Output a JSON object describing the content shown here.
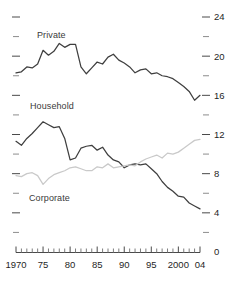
{
  "chart_data": {
    "type": "line",
    "title": "",
    "subtitle": "",
    "xlabel": "",
    "ylabel": "",
    "grid": false,
    "legend_position": "inline-annotations",
    "xlim": [
      1970,
      2004
    ],
    "ylim": [
      0,
      24
    ],
    "x_tick_labels": [
      "1970",
      "75",
      "80",
      "85",
      "90",
      "95",
      "2000",
      "04"
    ],
    "x_tick_values": [
      1970,
      1975,
      1980,
      1985,
      1990,
      1995,
      2000,
      2004
    ],
    "x_minor_step": 1,
    "y_tick_labels": [
      "0",
      "4",
      "8",
      "12",
      "16",
      "20",
      "24"
    ],
    "y_tick_values": [
      0,
      4,
      8,
      12,
      16,
      20,
      24
    ],
    "y_minor_values": [
      2,
      6,
      10,
      14,
      18,
      22
    ],
    "y_axis_side": "right",
    "x": [
      1970,
      1971,
      1972,
      1973,
      1974,
      1975,
      1976,
      1977,
      1978,
      1979,
      1980,
      1981,
      1982,
      1983,
      1984,
      1985,
      1986,
      1987,
      1988,
      1989,
      1990,
      1991,
      1992,
      1993,
      1994,
      1995,
      1996,
      1997,
      1998,
      1999,
      2000,
      2001,
      2002,
      2003,
      2004
    ],
    "series": [
      {
        "name": "Private",
        "color": "#3f3f3f",
        "label": "Private",
        "values": [
          18.3,
          18.4,
          18.9,
          18.8,
          19.2,
          20.6,
          20.1,
          20.5,
          21.3,
          20.9,
          21.2,
          21.2,
          18.9,
          18.2,
          18.8,
          19.4,
          19.2,
          19.9,
          20.2,
          19.6,
          19.3,
          18.9,
          18.3,
          18.6,
          18.7,
          18.2,
          18.3,
          18.0,
          17.9,
          17.7,
          17.3,
          16.9,
          16.4,
          15.5,
          16.0
        ]
      },
      {
        "name": "Household",
        "color": "#3f3f3f",
        "label": "Household",
        "values": [
          11.3,
          10.9,
          11.6,
          12.1,
          12.7,
          13.3,
          13.0,
          12.7,
          12.8,
          11.6,
          9.4,
          9.6,
          10.6,
          10.8,
          10.9,
          10.4,
          10.7,
          9.9,
          9.4,
          9.2,
          8.6,
          8.9,
          9.0,
          8.9,
          9.0,
          8.5,
          8.0,
          7.2,
          6.6,
          6.2,
          5.7,
          5.6,
          5.0,
          4.7,
          4.4
        ]
      },
      {
        "name": "Corporate",
        "color": "#c9c9c9",
        "label": "Corporate",
        "values": [
          7.8,
          7.7,
          8.0,
          8.1,
          7.8,
          6.9,
          7.5,
          7.9,
          8.1,
          8.3,
          8.6,
          8.7,
          8.5,
          8.3,
          8.3,
          8.7,
          8.6,
          9.0,
          8.6,
          8.7,
          8.8,
          8.9,
          8.8,
          9.2,
          9.5,
          9.7,
          9.9,
          9.6,
          10.1,
          10.0,
          10.2,
          10.6,
          11.0,
          11.4,
          11.5
        ]
      }
    ]
  }
}
